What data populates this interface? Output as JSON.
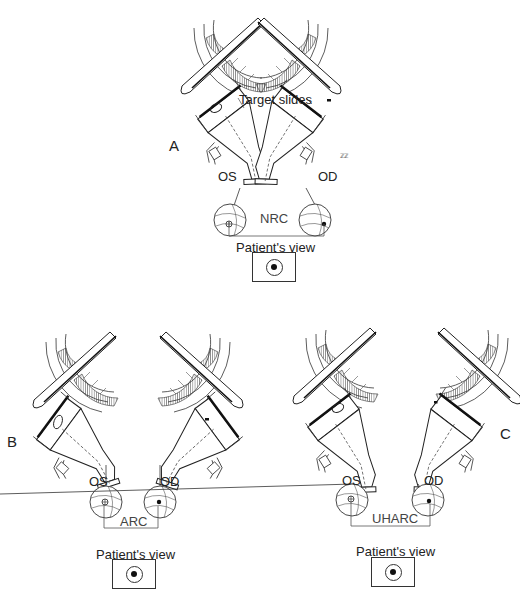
{
  "figure": {
    "panels": [
      {
        "id": "A",
        "letter": "A",
        "left_eye_label": "OS",
        "right_eye_label": "OD",
        "correspondence_label": "NRC",
        "patients_view_label": "Patient's view",
        "left_scale_ticks": [
          "10",
          "15",
          "20",
          "25"
        ],
        "right_scale_ticks": [
          "25",
          "20",
          "15",
          "10"
        ],
        "annotation": "Target slides"
      },
      {
        "id": "B",
        "letter": "B",
        "left_eye_label": "OS",
        "right_eye_label": "OD",
        "correspondence_label": "ARC",
        "patients_view_label": "Patient's view",
        "left_scale_ticks": [
          "5",
          "10",
          "15"
        ],
        "right_scale_ticks": [
          "15",
          "10",
          "5"
        ]
      },
      {
        "id": "C",
        "letter": "C",
        "left_eye_label": "OS",
        "right_eye_label": "OD",
        "correspondence_label": "UHARC",
        "patients_view_label": "Patient's view",
        "left_scale_ticks": [
          "10",
          "15",
          "20"
        ],
        "right_scale_ticks": [
          "20",
          "15",
          "10",
          "5"
        ]
      }
    ]
  }
}
